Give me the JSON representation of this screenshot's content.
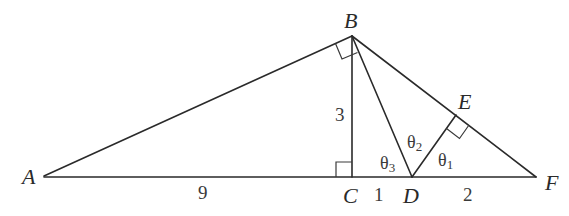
{
  "diagram": {
    "points": {
      "A": {
        "label": "A",
        "x": 44,
        "y": 176
      },
      "B": {
        "label": "B",
        "x": 352,
        "y": 36
      },
      "C": {
        "label": "C",
        "x": 352,
        "y": 177
      },
      "D": {
        "label": "D",
        "x": 412,
        "y": 177
      },
      "E": {
        "label": "E",
        "x": 456,
        "y": 115
      },
      "F": {
        "label": "F",
        "x": 536,
        "y": 177
      }
    },
    "lengths": {
      "AC": "9",
      "BC": "3",
      "CD": "1",
      "DF": "2"
    },
    "angles": {
      "theta1": {
        "base": "θ",
        "sub": "1"
      },
      "theta2": {
        "base": "θ",
        "sub": "2"
      },
      "theta3": {
        "base": "θ",
        "sub": "3"
      }
    },
    "right_angles": [
      "ABD",
      "BCA",
      "DEF"
    ]
  }
}
